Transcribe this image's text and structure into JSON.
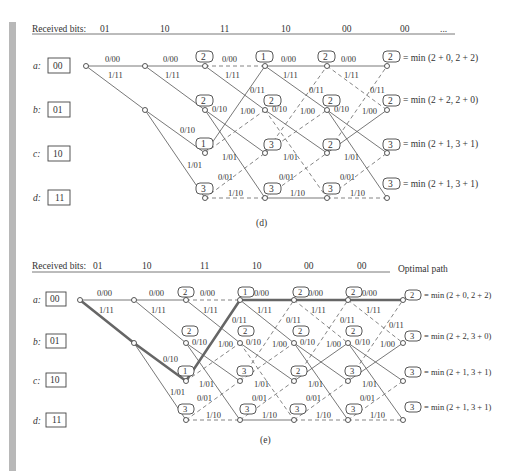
{
  "figure": "Viterbi decoding trellis",
  "panels": [
    {
      "id": "d",
      "caption": "(d)",
      "header": {
        "label": "Received bits:",
        "bits": [
          "01",
          "10",
          "11",
          "10",
          "00",
          "00"
        ],
        "trailing": "..."
      },
      "states": [
        {
          "name": "a:",
          "code": "00"
        },
        {
          "name": "b:",
          "code": "01"
        },
        {
          "name": "c:",
          "code": "10"
        },
        {
          "name": "d:",
          "code": "11"
        }
      ],
      "branch_labels": {
        "a_to_a": "0/00",
        "a_to_b": "1/11",
        "b_to_c": "0/10",
        "b_to_d": "1/01",
        "c_to_a": "0/11",
        "c_to_b": "1/00",
        "d_to_c": "0/01",
        "d_to_d": "1/10"
      },
      "metrics": {
        "col3": {
          "a": "2",
          "b": "2",
          "c": "1",
          "d": "3"
        },
        "col4": {
          "a": "1",
          "b": "2",
          "c": "3",
          "d": "3"
        },
        "col5": {
          "a": "2",
          "b": "2",
          "c": "2",
          "d": "3"
        },
        "col6": {
          "a": "2",
          "b": "2",
          "c": "3",
          "d": "3"
        }
      },
      "equations": {
        "a": "= min (2 + 0, 2 + 2)",
        "b": "= min (2 + 2, 2 + 0)",
        "c": "= min (2 + 1, 3 + 1)",
        "d": "= min (2 + 1, 3 + 1)"
      }
    },
    {
      "id": "e",
      "caption": "(e)",
      "header": {
        "label": "Received bits:",
        "bits": [
          "01",
          "10",
          "11",
          "10",
          "00",
          "00"
        ],
        "trailing": "Optimal path"
      },
      "states": [
        {
          "name": "a:",
          "code": "00"
        },
        {
          "name": "b:",
          "code": "01"
        },
        {
          "name": "c:",
          "code": "10"
        },
        {
          "name": "d:",
          "code": "11"
        }
      ],
      "metrics": {
        "col3": {
          "a": "2",
          "b": "2",
          "c": "1",
          "d": "3"
        },
        "col4": {
          "a": "1",
          "b": "2",
          "c": "3",
          "d": "3"
        },
        "col5": {
          "a": "2",
          "b": "2",
          "c": "2",
          "d": "3"
        },
        "col6": {
          "a": "2",
          "b": "2",
          "c": "3",
          "d": "3"
        },
        "col7": {
          "a": "2",
          "b": "3",
          "c": "3",
          "d": "3"
        }
      },
      "equations": {
        "a": "= min (2 + 0, 2 + 2)",
        "b": "= min (2 + 2, 3 + 0)",
        "c": "= min (2 + 1, 3 + 1)",
        "d": "= min (2 + 1, 3 + 1)"
      },
      "optimal_path_states": [
        "a",
        "b",
        "c",
        "a",
        "a",
        "a",
        "a"
      ]
    }
  ]
}
